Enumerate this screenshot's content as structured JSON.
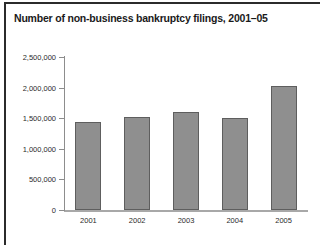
{
  "chart_data": {
    "type": "bar",
    "title": "Number of non-business bankruptcy filings, 2001–05",
    "xlabel": "",
    "ylabel": "",
    "categories": [
      "2001",
      "2002",
      "2003",
      "2004",
      "2005"
    ],
    "values": [
      1440000,
      1520000,
      1600000,
      1500000,
      2030000
    ],
    "ylim": [
      0,
      2500000
    ],
    "ytick_values": [
      0,
      500000,
      1000000,
      1500000,
      2000000,
      2500000
    ],
    "ytick_labels": [
      "0",
      "500,000",
      "1,000,000",
      "1,500,000",
      "2,000,000",
      "2,500,000"
    ],
    "grid": false,
    "legend": false,
    "bar_color": "#8f8f8f",
    "bar_edge_color": "#5e5e5e",
    "axis_color": "#8d8d8d",
    "text_color": "#2b2b2b",
    "background": "#ffffff"
  }
}
